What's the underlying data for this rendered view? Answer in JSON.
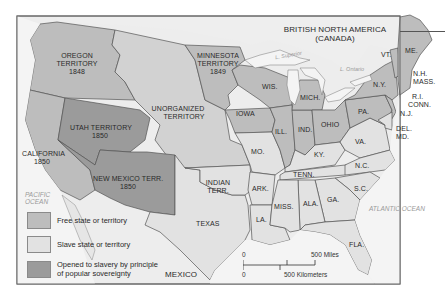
{
  "map": {
    "title_region": {
      "line1": "BRITISH NORTH AMERICA",
      "line2": "(CANADA)"
    },
    "colors": {
      "free": "#bdbdbd",
      "slave": "#e2e2e2",
      "popular_sovereignty": "#9b9b9b",
      "unorganized": "#d2d2d2",
      "water": "#f4f4f4",
      "border": "#555555",
      "frame": "#666666"
    },
    "territories": {
      "oregon": {
        "name": "OREGON",
        "line2": "TERRITORY",
        "year": "1848"
      },
      "minnesota": {
        "name": "MINNESOTA",
        "line2": "TERRITORY",
        "year": "1849"
      },
      "unorganized": {
        "name": "UNORGANIZED",
        "line2": "TERRITORY"
      },
      "utah": {
        "name": "UTAH TERRITORY",
        "year": "1850"
      },
      "new_mexico": {
        "name": "NEW MEXICO TERR.",
        "year": "1850"
      },
      "california": {
        "name": "CALIFORNIA",
        "year": "1850"
      },
      "indian": {
        "name": "INDIAN",
        "line2": "TERR."
      }
    },
    "states": {
      "wis": "WIS.",
      "mich": "MICH.",
      "iowa": "IOWA",
      "ill": "ILL.",
      "ind": "IND.",
      "ohio": "OHIO",
      "pa": "PA.",
      "ny": "N.Y.",
      "vt": "VT.",
      "me": "ME.",
      "nh": "N.H.",
      "mass": "MASS.",
      "ri": "R.I.",
      "conn": "CONN.",
      "nj": "N.J.",
      "del": "DEL.",
      "md": "MD.",
      "va": "VA.",
      "ky": "KY.",
      "mo": "MO.",
      "tenn": "TENN.",
      "nc": "N.C.",
      "sc": "S.C.",
      "ga": "GA.",
      "ala": "ALA.",
      "miss": "MISS.",
      "la": "LA.",
      "ark": "ARK.",
      "fla": "FLA.",
      "texas": "TEXAS"
    },
    "water_labels": {
      "pacific": {
        "line1": "PACIFIC",
        "line2": "OCEAN"
      },
      "atlantic": "ATLANTIC OCEAN",
      "superior": "L. Superior",
      "michigan": "L. Michigan",
      "huron": "L. Huron",
      "ontario": "L. Ontario"
    },
    "mexico": "MEXICO",
    "legend": [
      {
        "label": "Free state or territory",
        "color": "#bdbdbd"
      },
      {
        "label": "Slave state or territory",
        "color": "#e2e2e2"
      },
      {
        "label": "Opened to slavery by principle",
        "label2": "of popular sovereignty",
        "color": "#9b9b9b"
      }
    ],
    "scale": {
      "miles_zero": "0",
      "miles": "500 Miles",
      "km_zero": "0",
      "km": "500 Kilometers"
    }
  }
}
